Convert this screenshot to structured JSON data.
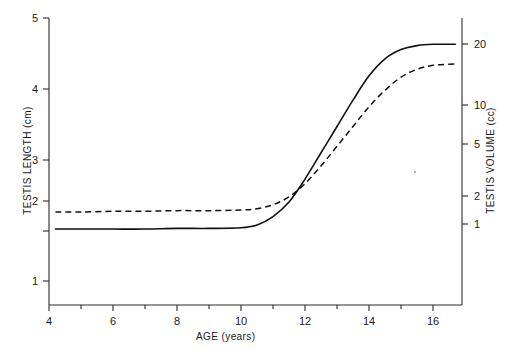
{
  "chart_data": {
    "type": "line",
    "title": "",
    "xlabel": "AGE (years)",
    "ylabel": "TESTIS LENGTH (cm)",
    "ylabel_right": "TESTIS VOLUME (cc)",
    "xlim": [
      4,
      17
    ],
    "ylim": [
      0.5,
      5
    ],
    "ylim_right": [
      0.8,
      22
    ],
    "yscale_right": "log",
    "grid": false,
    "legend": "none",
    "xticks": [
      4,
      6,
      8,
      10,
      12,
      14,
      16
    ],
    "xtick_labels": [
      "4",
      "6",
      "8",
      "10",
      "12",
      "14",
      "16"
    ],
    "xminor_ticks": [
      5,
      7,
      9,
      11,
      13,
      15
    ],
    "yticks_left": [
      1,
      2,
      3,
      4,
      5
    ],
    "ytick_labels_left": [
      "1",
      "2",
      "3",
      "4",
      "5"
    ],
    "yticks_right": [
      1,
      2,
      5,
      10,
      20
    ],
    "ytick_labels_right": [
      "1",
      "2",
      "5",
      "10",
      "20"
    ],
    "x": [
      4.2,
      5,
      6,
      7,
      8,
      9,
      10,
      10.5,
      11,
      11.5,
      12,
      12.5,
      13,
      13.5,
      14,
      14.5,
      15,
      15.5,
      16,
      16.7
    ],
    "series": [
      {
        "name": "Testis length (solid)",
        "style": "solid",
        "unit": "cm",
        "values": [
          1.79,
          1.79,
          1.79,
          1.79,
          1.8,
          1.8,
          1.81,
          1.85,
          1.98,
          2.2,
          2.55,
          2.95,
          3.35,
          3.75,
          4.12,
          4.38,
          4.52,
          4.58,
          4.6,
          4.6
        ]
      },
      {
        "name": "Testis volume (dashed)",
        "style": "dashed",
        "unit": "cc",
        "values": [
          2.05,
          2.05,
          2.06,
          2.06,
          2.07,
          2.07,
          2.08,
          2.1,
          2.16,
          2.28,
          2.48,
          2.75,
          3.05,
          3.35,
          3.65,
          3.9,
          4.1,
          4.22,
          4.28,
          4.3
        ]
      }
    ],
    "annotations": [
      {
        "name": "crossover",
        "x": 11.6,
        "note": "solid curve crosses dashed curve"
      }
    ]
  },
  "colors": {
    "axis": "#2a2a2a",
    "curve": "#111111",
    "background": "#ffffff",
    "text": "#1a1a1a"
  }
}
